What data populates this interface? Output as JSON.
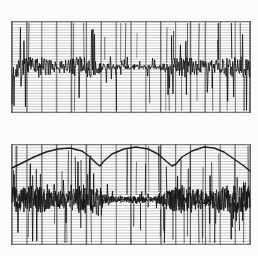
{
  "document": {
    "kind": "scanned-strip-chart-recording",
    "title": "Two-channel chart recorder trace",
    "background_color": "#fcfcfb",
    "ink_color": "#151515",
    "grid_color": "#5a5a5a",
    "grid_minor_color": "#8c8c8c"
  },
  "chart_data": {
    "type": "line",
    "subtitle": "",
    "xlabel": "",
    "ylabel": "",
    "grid": "true",
    "legend_position": "none",
    "panels": [
      {
        "name": "upper-trace-panel",
        "label": "Channel 1",
        "x_px": 11,
        "y_px": 21,
        "width_px": 240,
        "height_px": 92,
        "baseline_frac": 0.5,
        "vertical_divisions": 16,
        "horizontal_rulings": 34,
        "trace_style": "dense-noise-burst",
        "amplitude_frac": 0.34,
        "envelope": [],
        "series": [
          {
            "name": "channel-1-noise",
            "sample_count": 480,
            "seed": 1977,
            "base_amp": 0.14,
            "burst_amp": 0.42,
            "spike_rate": 0.07,
            "values": [
              0.06,
              -0.09,
              0.14,
              -0.2,
              0.31,
              -0.12,
              0.08,
              -0.27,
              0.18,
              -0.33,
              0.22,
              -0.1,
              0.27,
              -0.19,
              0.12,
              -0.36,
              0.3,
              -0.14,
              0.2,
              -0.25,
              0.11,
              -0.18,
              0.34,
              -0.22,
              0.16,
              -0.3,
              0.24,
              -0.11,
              0.29,
              -0.21,
              0.13,
              -0.28,
              0.19,
              -0.15,
              0.36,
              -0.23,
              0.1,
              -0.32,
              0.26,
              -0.17,
              0.21,
              -0.26,
              0.15,
              -0.35,
              0.28,
              -0.13,
              0.23,
              -0.29,
              0.17,
              -0.2,
              0.32,
              -0.16,
              0.25,
              -0.31,
              0.12,
              -0.24,
              0.3,
              -0.18,
              0.2,
              -0.34
            ]
          }
        ]
      },
      {
        "name": "lower-trace-panel",
        "label": "Channel 2",
        "x_px": 11,
        "y_px": 144,
        "width_px": 240,
        "height_px": 101,
        "baseline_frac": 0.55,
        "vertical_divisions": 16,
        "horizontal_rulings": 36,
        "trace_style": "dense-noise-band-with-envelope",
        "amplitude_frac": 0.3,
        "series": [
          {
            "name": "channel-2-noise",
            "sample_count": 520,
            "seed": 4211,
            "base_amp": 0.2,
            "burst_amp": 0.4,
            "spike_rate": 0.05,
            "values": [
              0.22,
              -0.19,
              0.3,
              -0.26,
              0.18,
              -0.33,
              0.27,
              -0.15,
              0.35,
              -0.24,
              0.2,
              -0.29,
              0.31,
              -0.17,
              0.25,
              -0.36,
              0.19,
              -0.22,
              0.33,
              -0.28,
              0.16,
              -0.31,
              0.29,
              -0.2,
              0.24,
              -0.34,
              0.21,
              -0.18,
              0.32,
              -0.25,
              0.17,
              -0.3,
              0.26,
              -0.23,
              0.34,
              -0.19,
              0.23,
              -0.27,
              0.3,
              -0.16,
              0.28,
              -0.32,
              0.2,
              -0.21,
              0.35,
              -0.26,
              0.18,
              -0.29,
              0.31,
              -0.24,
              0.22,
              -0.35,
              0.27,
              -0.18,
              0.33,
              -0.2,
              0.25,
              -0.31,
              0.19,
              -0.28
            ]
          },
          {
            "name": "channel-2-envelope-arc",
            "style": "scalloped-arc",
            "stroke_width_px": 1.4,
            "points_px": [
              [
                12,
                168
              ],
              [
                22,
                163
              ],
              [
                34,
                157
              ],
              [
                46,
                152
              ],
              [
                58,
                149
              ],
              [
                70,
                148
              ],
              [
                82,
                151
              ],
              [
                90,
                157
              ],
              [
                96,
                163
              ],
              [
                100,
                166
              ],
              [
                104,
                161
              ],
              [
                112,
                154
              ],
              [
                124,
                149
              ],
              [
                136,
                147
              ],
              [
                148,
                149
              ],
              [
                158,
                154
              ],
              [
                166,
                161
              ],
              [
                172,
                166
              ],
              [
                176,
                164
              ],
              [
                182,
                157
              ],
              [
                192,
                151
              ],
              [
                204,
                147
              ],
              [
                214,
                148
              ],
              [
                224,
                152
              ],
              [
                234,
                159
              ],
              [
                244,
                166
              ],
              [
                250,
                171
              ]
            ],
            "peak_x_px": [
              70,
              134,
              206
            ],
            "valley_x_px": [
              99,
              174
            ],
            "description": "three broad humps separated by two sharp V notches"
          }
        ]
      }
    ],
    "x": [
      0,
      1,
      2,
      3,
      4,
      5,
      6,
      7,
      8,
      9,
      10,
      11,
      12,
      13,
      14,
      15,
      16
    ],
    "xlim": [
      0,
      16
    ],
    "ylim": [
      -1,
      1
    ],
    "tick_labels": [],
    "annotations": []
  }
}
